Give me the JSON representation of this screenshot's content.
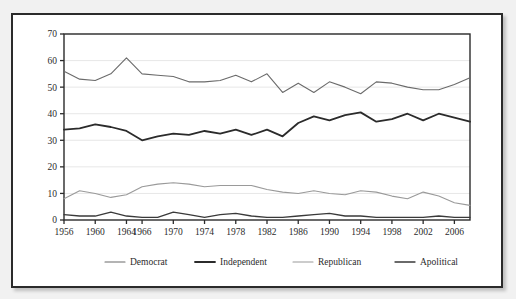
{
  "figure": {
    "background_color": "#f1f1f1",
    "panel_color": "#ffffff",
    "border_color": "#2b2b2b"
  },
  "chart_data": {
    "type": "line",
    "title": "",
    "subtitle": "",
    "xlabel": "",
    "ylabel": "",
    "xlim": [
      1956,
      2008
    ],
    "ylim": [
      0,
      70
    ],
    "yticks": [
      0,
      10,
      20,
      30,
      40,
      50,
      60,
      70
    ],
    "xticks": [
      1956,
      1960,
      1964,
      1966,
      1970,
      1974,
      1978,
      1982,
      1986,
      1990,
      1994,
      1998,
      2002,
      2006
    ],
    "xticklabels": [
      "1956",
      "1960",
      "1964",
      "1966",
      "1970",
      "1974",
      "1978",
      "1982",
      "1986",
      "1990",
      "1994",
      "1998",
      "2002",
      "2006"
    ],
    "yticklabels": [
      "0",
      "10",
      "20",
      "30",
      "40",
      "50",
      "60",
      "70"
    ],
    "grid": "horizontal",
    "grid_color": "#e4e4e4",
    "legend_position": "bottom",
    "x": [
      1956,
      1958,
      1960,
      1962,
      1964,
      1966,
      1968,
      1970,
      1972,
      1974,
      1976,
      1978,
      1980,
      1982,
      1984,
      1986,
      1988,
      1990,
      1992,
      1994,
      1996,
      1998,
      2000,
      2002,
      2004,
      2006,
      2008
    ],
    "series": [
      {
        "name": "Democrat",
        "color": "#6b6b6b",
        "width": 1.1,
        "values": [
          56.0,
          53.0,
          52.5,
          55.0,
          61.0,
          55.0,
          54.5,
          54.0,
          52.0,
          52.0,
          52.5,
          54.5,
          52.0,
          55.0,
          48.0,
          51.5,
          48.0,
          52.0,
          50.0,
          47.5,
          52.0,
          51.5,
          50.0,
          49.0,
          49.0,
          51.0,
          53.5
        ]
      },
      {
        "name": "Independent",
        "color": "#2b2b2b",
        "width": 1.8,
        "values": [
          34.0,
          34.5,
          36.0,
          35.0,
          33.5,
          30.0,
          31.5,
          32.5,
          32.0,
          33.5,
          32.5,
          34.0,
          32.0,
          34.0,
          31.5,
          36.5,
          39.0,
          37.5,
          39.5,
          40.5,
          37.0,
          38.0,
          40.0,
          37.5,
          40.0,
          38.5,
          37.0
        ]
      },
      {
        "name": "Republican",
        "color": "#9a9a9a",
        "width": 1.1,
        "values": [
          8.0,
          11.0,
          10.0,
          8.5,
          9.5,
          12.5,
          13.5,
          14.0,
          13.5,
          12.5,
          13.0,
          13.0,
          13.0,
          11.5,
          10.5,
          10.0,
          11.0,
          10.0,
          9.5,
          11.0,
          10.5,
          9.0,
          8.0,
          10.5,
          9.0,
          6.5,
          5.5
        ]
      },
      {
        "name": "Apolitical",
        "color": "#3a3a3a",
        "width": 1.3,
        "values": [
          2.0,
          1.5,
          1.5,
          3.0,
          1.5,
          1.0,
          1.0,
          3.0,
          2.0,
          1.0,
          2.0,
          2.5,
          1.5,
          1.0,
          1.0,
          1.5,
          2.0,
          2.5,
          1.5,
          1.5,
          1.0,
          1.0,
          1.0,
          1.0,
          1.5,
          1.0,
          1.0
        ]
      }
    ]
  },
  "legend": {
    "items": [
      {
        "label": "Democrat",
        "color": "#6b6b6b",
        "width": 1.1
      },
      {
        "label": "Independent",
        "color": "#2b2b2b",
        "width": 1.8
      },
      {
        "label": "Republican",
        "color": "#9a9a9a",
        "width": 1.1
      },
      {
        "label": "Apolitical",
        "color": "#3a3a3a",
        "width": 1.3
      }
    ]
  }
}
